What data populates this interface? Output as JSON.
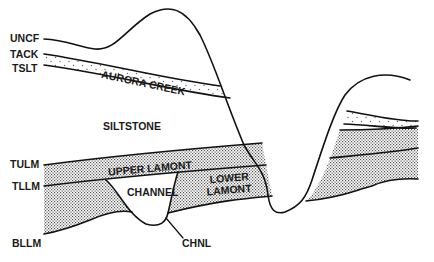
{
  "diagram": {
    "type": "geologic-cross-section",
    "horizon_labels": {
      "uncf": "UNCF",
      "tack": "TACK",
      "tslt": "TSLT",
      "tulm": "TULM",
      "tllm": "TLLM",
      "bllm": "BLLM",
      "chnl": "CHNL"
    },
    "unit_labels": {
      "aurora_creek": "AURORA CREEK",
      "siltstone": "SILTSTONE",
      "upper_lamont": "UPPER LAMONT",
      "channel": "CHANNEL",
      "lower_lamont_1": "LOWER",
      "lower_lamont_2": "LAMONT"
    },
    "colors": {
      "line": "#111111",
      "background": "#ffffff",
      "dense_stipple": "#555555",
      "sparse_stipple": "#666666"
    }
  }
}
